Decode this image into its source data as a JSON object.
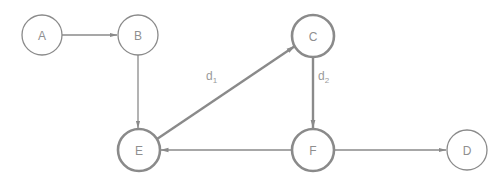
{
  "diagram": {
    "type": "directed-graph",
    "colors": {
      "stroke": "#8a8a8a",
      "text": "#8f8f8f",
      "background": "#ffffff"
    },
    "nodes": [
      {
        "id": "A",
        "label": "A",
        "cx": 42,
        "cy": 35,
        "r": 20,
        "emphasis": false
      },
      {
        "id": "B",
        "label": "B",
        "cx": 138,
        "cy": 35,
        "r": 20,
        "emphasis": false
      },
      {
        "id": "C",
        "label": "C",
        "cx": 313,
        "cy": 36,
        "r": 21,
        "emphasis": true
      },
      {
        "id": "E",
        "label": "E",
        "cx": 139,
        "cy": 150,
        "r": 21,
        "emphasis": true
      },
      {
        "id": "F",
        "label": "F",
        "cx": 313,
        "cy": 150,
        "r": 21,
        "emphasis": true
      },
      {
        "id": "D",
        "label": "D",
        "cx": 467,
        "cy": 150,
        "r": 20,
        "emphasis": false
      }
    ],
    "edges": [
      {
        "from": "A",
        "to": "B",
        "label": "",
        "emphasis": false
      },
      {
        "from": "B",
        "to": "E",
        "label": "",
        "emphasis": false
      },
      {
        "from": "E",
        "to": "C",
        "label": "d",
        "subscript": "1",
        "emphasis": true
      },
      {
        "from": "C",
        "to": "F",
        "label": "d",
        "subscript": "2",
        "emphasis": true
      },
      {
        "from": "F",
        "to": "E",
        "label": "",
        "emphasis": false
      },
      {
        "from": "F",
        "to": "D",
        "label": "",
        "emphasis": false
      }
    ],
    "edge_labels": {
      "d1": {
        "main": "d",
        "sub": "1"
      },
      "d2": {
        "main": "d",
        "sub": "2"
      }
    }
  }
}
